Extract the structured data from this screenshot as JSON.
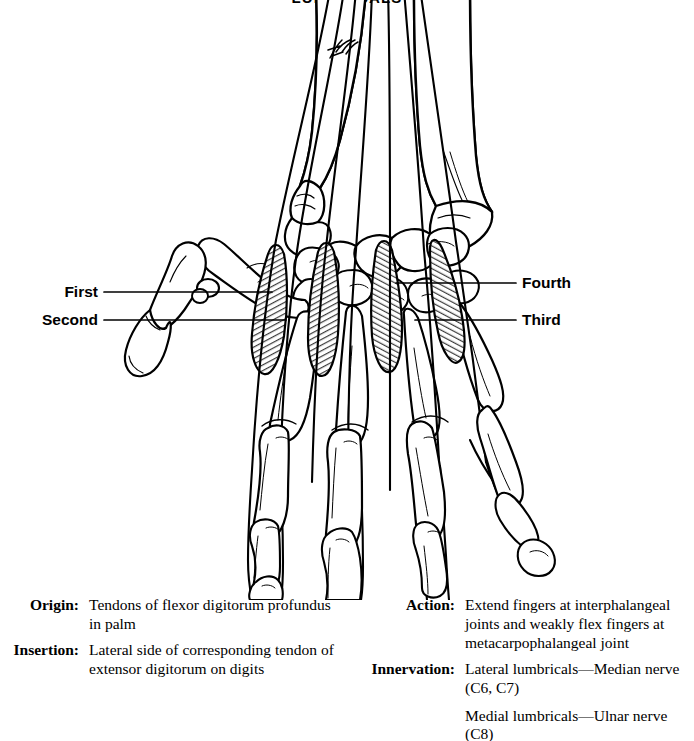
{
  "figure": {
    "title": "LUMBRICALS",
    "artist_signature": "Firth",
    "view_description": "Dorsal view of skeletal right hand showing the four lumbrical muscles arising from the flexor digitorum profundus tendons and inserting into the extensor expansions"
  },
  "callouts": [
    {
      "id": "first",
      "label": "First",
      "side": "left"
    },
    {
      "id": "second",
      "label": "Second",
      "side": "left"
    },
    {
      "id": "third",
      "label": "Third",
      "side": "right"
    },
    {
      "id": "fourth",
      "label": "Fourth",
      "side": "right"
    }
  ],
  "attributes": {
    "left": [
      {
        "key": "Origin:",
        "lines": [
          "Tendons of flexor digitorum profundus in palm"
        ]
      },
      {
        "key": "Insertion:",
        "lines": [
          "Lateral side of corresponding tendon of extensor digitorum on digits"
        ]
      }
    ],
    "right": [
      {
        "key": "Action:",
        "lines": [
          "Extend fingers at interphalangeal joints and weakly flex fingers at metacarpophalangeal joint"
        ]
      },
      {
        "key": "Innervation:",
        "lines": [
          "Lateral lumbricals—Median nerve (C6, C7)",
          "Medial lumbricals—Ulnar nerve (C8)"
        ]
      }
    ]
  },
  "colors": {
    "ink": "#000000",
    "background": "#ffffff",
    "muscle_shading": "#6e6e6e",
    "bone_fill": "#ffffff"
  }
}
